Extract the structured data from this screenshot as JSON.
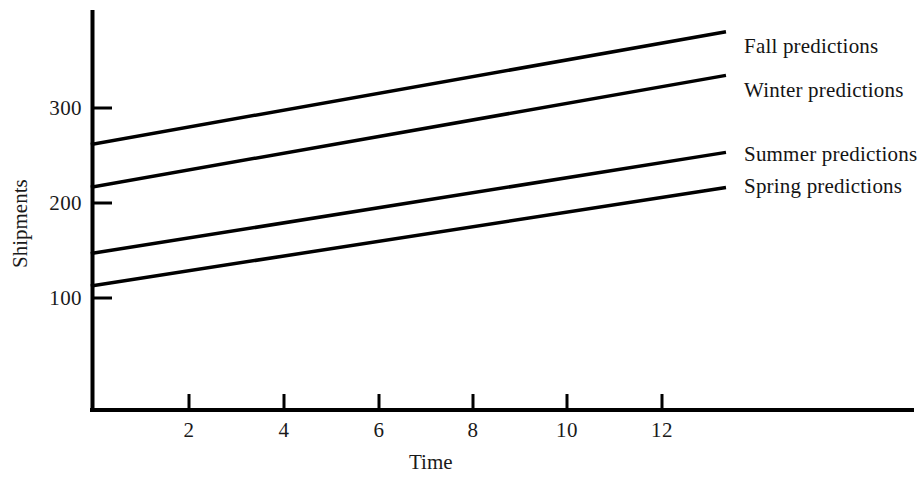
{
  "chart_data": {
    "type": "line",
    "title": "",
    "xlabel": "Time",
    "ylabel": "Shipments",
    "xlim": [
      0,
      14.3
    ],
    "ylim": [
      0,
      420
    ],
    "grid": false,
    "legend_position": "right-inline-labels",
    "xticks": [
      2,
      4,
      6,
      8,
      10,
      12
    ],
    "xtick_labels": [
      "2",
      "4",
      "6",
      "8",
      "10",
      "12"
    ],
    "yticks": [
      100,
      200,
      300
    ],
    "ytick_labels": [
      "100",
      "200",
      "300"
    ],
    "series": [
      {
        "name": "Fall predictions",
        "label": "Fall predictions",
        "color": "#000000",
        "x": [
          0,
          13.3
        ],
        "values": [
          262,
          380
        ]
      },
      {
        "name": "Winter predictions",
        "label": "Winter predictions",
        "color": "#000000",
        "x": [
          0,
          13.3
        ],
        "values": [
          217,
          334
        ]
      },
      {
        "name": "Summer predictions",
        "label": "Summer predictions",
        "color": "#000000",
        "x": [
          0,
          13.3
        ],
        "values": [
          147,
          253
        ]
      },
      {
        "name": "Spring predictions",
        "label": "Spring predictions",
        "color": "#000000",
        "x": [
          0,
          13.3
        ],
        "values": [
          113,
          216
        ]
      }
    ]
  },
  "labels": {
    "y_axis_title": "Shipments",
    "x_axis_title": "Time",
    "ytick_300": "300",
    "ytick_200": "200",
    "ytick_100": "100",
    "xtick_2": "2",
    "xtick_4": "4",
    "xtick_6": "6",
    "xtick_8": "8",
    "xtick_10": "10",
    "xtick_12": "12",
    "series_fall": "Fall predictions",
    "series_winter": "Winter predictions",
    "series_summer": "Summer predictions",
    "series_spring": "Spring predictions"
  }
}
